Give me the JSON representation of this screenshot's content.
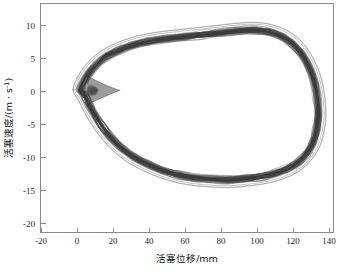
{
  "chart_data": {
    "type": "line",
    "title": "",
    "subtitle": "",
    "xlabel": "活塞位移/mm",
    "ylabel": "活塞速度/(m · s-1)",
    "ylabel_parts": {
      "text": "活塞速度/(m · s",
      "superscript": "-1",
      "tail": ")"
    },
    "xlim": [
      -20,
      148
    ],
    "ylim": [
      -20,
      12
    ],
    "xticks": [
      -20,
      0,
      20,
      40,
      60,
      80,
      100,
      120,
      140
    ],
    "xticklabels": [
      "-20",
      "0",
      "20",
      "40",
      "60",
      "80",
      "100",
      "120",
      "140"
    ],
    "yticks": [
      10,
      5,
      0,
      -5,
      -10,
      -15,
      -20
    ],
    "yticklabels": [
      "10",
      "5",
      "0",
      "-5",
      "-10",
      "-15",
      "-20"
    ],
    "grid": false,
    "legend": "none",
    "series": [
      {
        "name": "main-cycle-band",
        "role": "dense overlaid cycles",
        "color": "#4d4d4d",
        "band_half_width_mps": 0.9,
        "points": [
          {
            "x": 2.0,
            "y": 0.2
          },
          {
            "x": 4.0,
            "y": 1.6
          },
          {
            "x": 7.0,
            "y": 2.9
          },
          {
            "x": 11.0,
            "y": 4.1
          },
          {
            "x": 16.0,
            "y": 5.2
          },
          {
            "x": 23.0,
            "y": 6.2
          },
          {
            "x": 31.0,
            "y": 7.0
          },
          {
            "x": 40.0,
            "y": 7.6
          },
          {
            "x": 50.0,
            "y": 8.0
          },
          {
            "x": 60.0,
            "y": 8.3
          },
          {
            "x": 70.0,
            "y": 8.6
          },
          {
            "x": 80.0,
            "y": 8.9
          },
          {
            "x": 90.0,
            "y": 9.2
          },
          {
            "x": 99.0,
            "y": 9.3
          },
          {
            "x": 107.0,
            "y": 9.0
          },
          {
            "x": 114.0,
            "y": 8.3
          },
          {
            "x": 120.0,
            "y": 7.2
          },
          {
            "x": 125.0,
            "y": 5.6
          },
          {
            "x": 129.0,
            "y": 3.6
          },
          {
            "x": 132.0,
            "y": 1.3
          },
          {
            "x": 133.5,
            "y": -1.2
          },
          {
            "x": 134.0,
            "y": -3.6
          },
          {
            "x": 133.0,
            "y": -5.9
          },
          {
            "x": 131.0,
            "y": -7.8
          },
          {
            "x": 127.5,
            "y": -9.4
          },
          {
            "x": 123.0,
            "y": -10.7
          },
          {
            "x": 117.0,
            "y": -11.7
          },
          {
            "x": 110.0,
            "y": -12.4
          },
          {
            "x": 102.0,
            "y": -12.9
          },
          {
            "x": 93.0,
            "y": -13.2
          },
          {
            "x": 84.0,
            "y": -13.4
          },
          {
            "x": 75.0,
            "y": -13.3
          },
          {
            "x": 66.0,
            "y": -13.1
          },
          {
            "x": 57.0,
            "y": -12.7
          },
          {
            "x": 48.0,
            "y": -12.0
          },
          {
            "x": 40.0,
            "y": -11.1
          },
          {
            "x": 32.0,
            "y": -10.0
          },
          {
            "x": 25.0,
            "y": -8.6
          },
          {
            "x": 19.0,
            "y": -7.0
          },
          {
            "x": 14.0,
            "y": -5.3
          },
          {
            "x": 10.0,
            "y": -3.6
          },
          {
            "x": 7.0,
            "y": -2.1
          },
          {
            "x": 5.0,
            "y": -1.0
          },
          {
            "x": 3.5,
            "y": -0.3
          },
          {
            "x": 2.0,
            "y": 0.2
          }
        ],
        "notch": {
          "description": "pinch/notch near zero displacement where velocity crosses zero",
          "x_range": [
            6,
            24
          ],
          "y_range": [
            -1.6,
            2.0
          ]
        }
      },
      {
        "name": "outlier-cycle-upper",
        "role": "single deviating cycle above band",
        "color": "#9e9e9e",
        "offset_mps": 1.3
      },
      {
        "name": "outlier-cycle-lower",
        "role": "single deviating cycle below band",
        "color": "#9e9e9e",
        "offset_mps": -1.9
      }
    ]
  },
  "axes": {
    "x_title": "活塞位移/mm",
    "y_title_main": "活塞速度/(m · s",
    "y_title_sup": "-1",
    "y_title_tail": ")"
  }
}
